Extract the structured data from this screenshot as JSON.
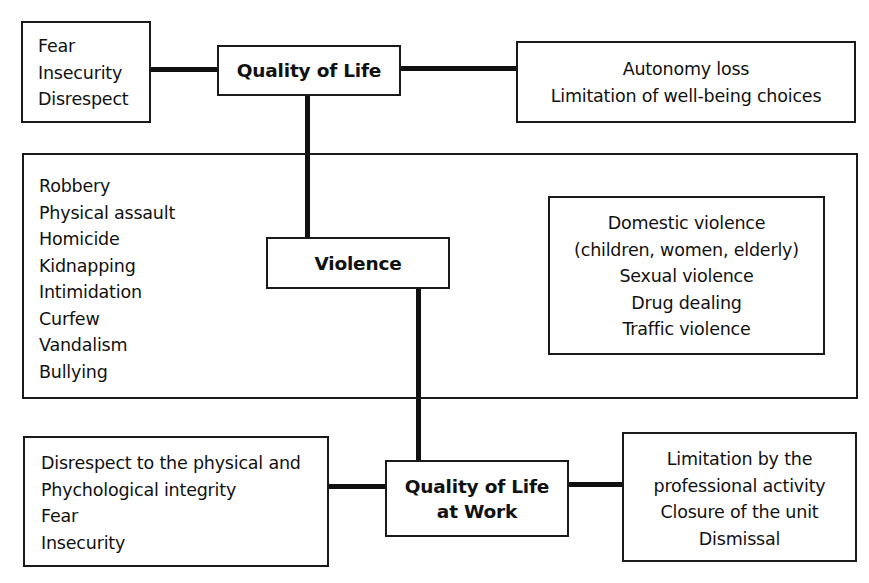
{
  "diagram": {
    "nodes": {
      "quality_of_life": {
        "label": "Quality of Life"
      },
      "violence": {
        "label": "Violence"
      },
      "quality_of_life_at_work": {
        "line1": "Quality of Life",
        "line2": "at Work"
      }
    },
    "qol_left": {
      "items": [
        "Fear",
        "Insecurity",
        "Disrespect"
      ]
    },
    "qol_right": {
      "items": [
        "Autonomy loss",
        "Limitation of well-being choices"
      ]
    },
    "violence_left": {
      "items": [
        "Robbery",
        "Physical assault",
        "Homicide",
        "Kidnapping",
        "Intimidation",
        "Curfew",
        "Vandalism",
        "Bullying"
      ]
    },
    "violence_right": {
      "items": [
        "Domestic violence",
        "(children, women, elderly)",
        "Sexual violence",
        "Drug dealing",
        "Traffic violence"
      ]
    },
    "work_left": {
      "items": [
        "Disrespect to the physical and",
        "Phychological integrity",
        "Fear",
        "Insecurity"
      ]
    },
    "work_right": {
      "items": [
        "Limitation by the",
        "professional activity",
        "Closure of the unit",
        "Dismissal"
      ]
    },
    "edges": [
      {
        "from": "qol_left",
        "to": "quality_of_life"
      },
      {
        "from": "quality_of_life",
        "to": "qol_right"
      },
      {
        "from": "quality_of_life",
        "to": "violence"
      },
      {
        "from": "violence",
        "to": "quality_of_life_at_work"
      },
      {
        "from": "work_left",
        "to": "quality_of_life_at_work"
      },
      {
        "from": "quality_of_life_at_work",
        "to": "work_right"
      }
    ]
  }
}
